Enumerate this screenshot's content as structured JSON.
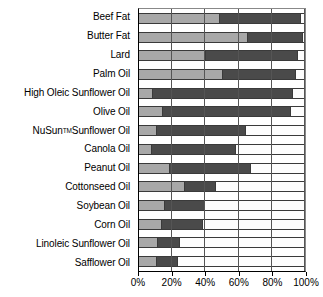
{
  "chart_data": {
    "type": "bar",
    "orientation": "horizontal",
    "stacked": true,
    "title": "",
    "xlabel": "",
    "ylabel": "",
    "xlim": [
      0,
      100
    ],
    "xticks": [
      "0%",
      "20%",
      "40%",
      "60%",
      "80%",
      "100%"
    ],
    "xtick_values": [
      0,
      20,
      40,
      60,
      80,
      100
    ],
    "grid": true,
    "legend": "none",
    "colors": {
      "saturated": "#a8a8a8",
      "monounsaturated": "#4a4a4a",
      "polyunsaturated": "#fdfdfd",
      "outline": "#3a3a3a",
      "axis": "#000000"
    },
    "series": [
      {
        "name": "Saturated",
        "color": "#a8a8a8",
        "values": [
          48,
          65,
          40,
          50,
          8,
          14,
          10,
          7,
          18,
          27,
          15,
          13,
          11,
          10
        ]
      },
      {
        "name": "Monounsaturated",
        "color": "#4a4a4a",
        "values": [
          49,
          33,
          55,
          44,
          84,
          77,
          54,
          51,
          49,
          19,
          24,
          25,
          13,
          13
        ]
      },
      {
        "name": "Polyunsaturated",
        "color": "#fdfdfd",
        "values": [
          3,
          2,
          5,
          6,
          8,
          9,
          36,
          42,
          33,
          54,
          61,
          62,
          76,
          77
        ]
      }
    ],
    "categories": [
      "Beef Fat",
      "Butter Fat",
      "Lard",
      "Palm Oil",
      "High Oleic Sunflower Oil",
      "Olive Oil",
      "NuSun Sunflower Oil",
      "Canola Oil",
      "Peanut Oil",
      "Cottonseed Oil",
      "Soybean Oil",
      "Corn Oil",
      "Linoleic Sunflower Oil",
      "Safflower Oil"
    ],
    "category_labels": [
      {
        "text": "Beef Fat",
        "sup": ""
      },
      {
        "text": "Butter Fat",
        "sup": ""
      },
      {
        "text": "Lard",
        "sup": ""
      },
      {
        "text": "Palm Oil",
        "sup": ""
      },
      {
        "text": "High Oleic Sunflower Oil",
        "sup": ""
      },
      {
        "text": "Olive Oil",
        "sup": ""
      },
      {
        "text": "NuSun",
        "sup": "TM",
        "text2": " Sunflower Oil"
      },
      {
        "text": "Canola Oil",
        "sup": ""
      },
      {
        "text": "Peanut Oil",
        "sup": ""
      },
      {
        "text": "Cottonseed Oil",
        "sup": ""
      },
      {
        "text": "Soybean Oil",
        "sup": ""
      },
      {
        "text": "Corn Oil",
        "sup": ""
      },
      {
        "text": "Linoleic Sunflower Oil",
        "sup": ""
      },
      {
        "text": "Safflower Oil",
        "sup": ""
      }
    ]
  }
}
